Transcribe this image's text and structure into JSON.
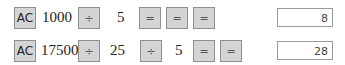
{
  "rows": [
    {
      "keys": {
        "clear": "AC",
        "num1": "1000",
        "op1": "÷",
        "num2": "5",
        "eq1": "=",
        "eq2": "=",
        "eq3": "="
      },
      "result": "8"
    },
    {
      "keys": {
        "clear": "AC",
        "num1": "17500",
        "op1": "÷",
        "num2": "25",
        "op2": "÷",
        "num3": "5",
        "eq1": "=",
        "eq2": "="
      },
      "result": "28"
    }
  ]
}
